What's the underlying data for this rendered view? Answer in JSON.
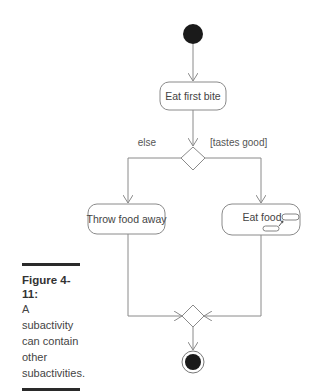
{
  "diagram": {
    "type": "UML activity diagram",
    "nodes": {
      "start": {
        "kind": "initial-node"
      },
      "eat_first_bite": {
        "kind": "action",
        "label": "Eat first bite"
      },
      "decision": {
        "kind": "decision-node"
      },
      "throw_food_away": {
        "kind": "action",
        "label": "Throw food away"
      },
      "eat_food": {
        "kind": "subactivity",
        "label": "Eat food"
      },
      "merge": {
        "kind": "merge-node"
      },
      "end": {
        "kind": "final-node"
      }
    },
    "guards": {
      "else": "else",
      "tastes_good": "[tastes good]"
    },
    "edges": [
      {
        "from": "start",
        "to": "eat_first_bite"
      },
      {
        "from": "eat_first_bite",
        "to": "decision"
      },
      {
        "from": "decision",
        "to": "throw_food_away",
        "guard": "else"
      },
      {
        "from": "decision",
        "to": "eat_food",
        "guard": "[tastes good]"
      },
      {
        "from": "throw_food_away",
        "to": "merge"
      },
      {
        "from": "eat_food",
        "to": "merge"
      },
      {
        "from": "merge",
        "to": "end"
      }
    ]
  },
  "caption": {
    "title": "Figure 4-11:",
    "lines": [
      "A",
      "subactivity",
      "can contain",
      "other",
      "subactivities."
    ]
  },
  "colors": {
    "line": "#8a8a8a",
    "node_fill": "#1a1a1a",
    "text": "#444444"
  }
}
